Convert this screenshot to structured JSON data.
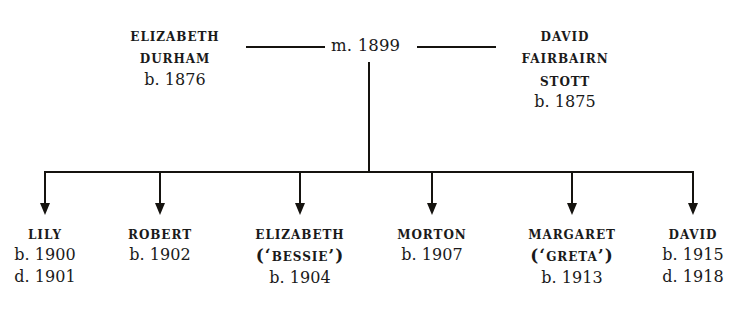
{
  "diagram": {
    "type": "family-tree",
    "ink_color": "#15130f",
    "background_color": "#ffffff"
  },
  "marriage": {
    "label": "m. 1899",
    "left_rule": true,
    "right_rule": true
  },
  "parents": [
    {
      "id": "elizabeth-durham",
      "name_lines": [
        "Elizabeth",
        "Durham"
      ],
      "name_line_1": "Elizabeth",
      "name_line_2": "Durham",
      "birth": "b. 1876"
    },
    {
      "id": "david-fairbairn-stott",
      "name_lines": [
        "David",
        "Fairbairn",
        "Stott"
      ],
      "name_line_1": "David",
      "name_line_2": "Fairbairn",
      "name_line_3": "Stott",
      "birth": "b. 1875"
    }
  ],
  "children": [
    {
      "id": "lily",
      "name": "Lily",
      "nickname": "",
      "birth": "b. 1900",
      "death": "d. 1901"
    },
    {
      "id": "robert",
      "name": "Robert",
      "nickname": "",
      "birth": "b. 1902",
      "death": ""
    },
    {
      "id": "elizabeth-bessie",
      "name": "Elizabeth",
      "nickname": "(‘Bessie’)",
      "birth": "b. 1904",
      "death": ""
    },
    {
      "id": "morton",
      "name": "Morton",
      "nickname": "",
      "birth": "b. 1907",
      "death": ""
    },
    {
      "id": "margaret-greta",
      "name": "Margaret",
      "nickname": "(‘Greta’)",
      "birth": "b. 1913",
      "death": ""
    },
    {
      "id": "david",
      "name": "David",
      "nickname": "",
      "birth": "b. 1915",
      "death": "d. 1918"
    }
  ]
}
